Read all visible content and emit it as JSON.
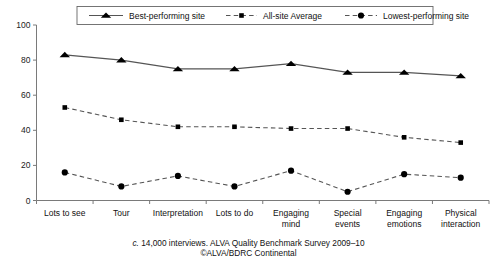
{
  "chart_data": {
    "type": "line",
    "title": "",
    "xlabel": "",
    "ylabel": "",
    "ylim": [
      0,
      100
    ],
    "yticks": [
      0,
      20,
      40,
      60,
      80,
      100
    ],
    "grid": false,
    "legend_position": "top-center",
    "categories": [
      "Lots to see",
      "Tour",
      "Interpretation",
      "Lots to do",
      "Engaging mind",
      "Special events",
      "Engaging emotions",
      "Physical interaction"
    ],
    "series": [
      {
        "name": "Best-performing site",
        "marker": "triangle",
        "linestyle": "solid",
        "values": [
          83,
          80,
          75,
          75,
          78,
          73,
          73,
          71
        ]
      },
      {
        "name": "All-site Average",
        "marker": "square",
        "linestyle": "dashed",
        "values": [
          53,
          46,
          42,
          42,
          41,
          41,
          36,
          33
        ]
      },
      {
        "name": "Lowest-performing site",
        "marker": "circle",
        "linestyle": "dashed",
        "values": [
          16,
          8,
          14,
          8,
          17,
          5,
          15,
          13
        ]
      }
    ],
    "annotations": {
      "caption_line1_italic_prefix": "c.",
      "caption_line1": "14,000 interviews. ALVA Quality Benchmark Survey 2009–10",
      "caption_line2": "©ALVA/BDRC Continental"
    }
  },
  "axis": {
    "tick_labels": [
      "0",
      "20",
      "40",
      "60",
      "80",
      "100"
    ],
    "category_labels": [
      [
        "Lots to see"
      ],
      [
        "Tour"
      ],
      [
        "Interpretation"
      ],
      [
        "Lots to do"
      ],
      [
        "Engaging",
        "mind"
      ],
      [
        "Special",
        "events"
      ],
      [
        "Engaging",
        "emotions"
      ],
      [
        "Physical",
        "interaction"
      ]
    ]
  },
  "legend": {
    "items": [
      {
        "label": "Best-performing site",
        "marker": "triangle-icon",
        "style": "solid"
      },
      {
        "label": "All-site Average",
        "marker": "square-icon",
        "style": "dashed"
      },
      {
        "label": "Lowest-performing site",
        "marker": "circle-icon",
        "style": "dashed"
      }
    ]
  },
  "colors": {
    "line": "#555555",
    "marker": "#000000",
    "axis": "#7a7a7a",
    "text": "#111111",
    "background": "#ffffff"
  }
}
